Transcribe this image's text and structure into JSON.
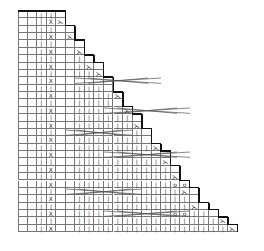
{
  "chart": {
    "title": "",
    "type": "knitting-chart",
    "cell_w": 9.55,
    "cell_h": 7.37,
    "rows": 30,
    "row_widths": [
      5,
      5,
      6,
      6,
      7,
      7,
      8,
      9,
      9,
      10,
      10,
      11,
      11,
      12,
      13,
      13,
      14,
      14,
      15,
      16,
      16,
      17,
      17,
      18,
      19,
      19,
      20,
      21,
      22,
      23
    ],
    "symbols": {
      "knit": "|",
      "twisted": "X",
      "decrease": "⋋",
      "yarn_over": "o",
      "purl_bar": "—"
    },
    "twisted_col": 3,
    "knit_start_col": 6,
    "cables": [
      {
        "row": 9,
        "from": 6,
        "to": 14
      },
      {
        "row": 13,
        "from": 9,
        "to": 17
      },
      {
        "row": 16,
        "from": 5,
        "to": 11
      },
      {
        "row": 19,
        "from": 9,
        "to": 17
      },
      {
        "row": 24,
        "from": 5,
        "to": 12
      },
      {
        "row": 27,
        "from": 9,
        "to": 17
      }
    ],
    "decreases": [
      [
        1,
        4
      ],
      [
        3,
        5
      ],
      [
        5,
        6
      ],
      [
        7,
        7
      ],
      [
        8,
        8
      ],
      [
        11,
        10
      ],
      [
        13,
        11
      ],
      [
        15,
        12
      ],
      [
        18,
        14
      ],
      [
        20,
        15
      ],
      [
        22,
        16
      ],
      [
        24,
        17
      ],
      [
        26,
        18
      ],
      [
        28,
        21
      ],
      [
        29,
        22
      ]
    ],
    "yarn_overs": [
      [
        23,
        16
      ],
      [
        23,
        17
      ],
      [
        27,
        16
      ],
      [
        27,
        17
      ]
    ],
    "accent_color": "#111111",
    "grid_color": "#777777"
  }
}
